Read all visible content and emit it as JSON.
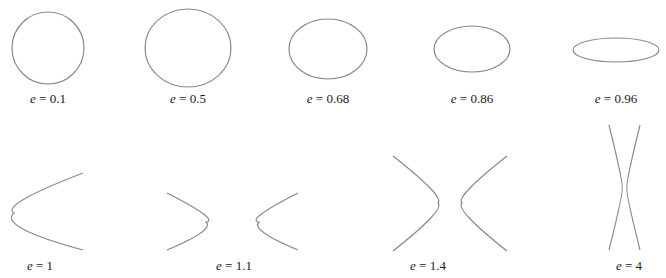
{
  "figure": {
    "stroke_color": "#8a8a8a",
    "text_color": "#222222",
    "variable": "e",
    "equals": " = ",
    "panels": [
      {
        "id": "e-0-1",
        "type": "ellipse",
        "e": "0.1",
        "label_x": 48,
        "label_y": 91
      },
      {
        "id": "e-0-5",
        "type": "ellipse",
        "e": "0.5",
        "label_x": 188,
        "label_y": 91
      },
      {
        "id": "e-0-68",
        "type": "ellipse",
        "e": "0.68",
        "label_x": 328,
        "label_y": 91
      },
      {
        "id": "e-0-86",
        "type": "ellipse",
        "e": "0.86",
        "label_x": 472,
        "label_y": 91
      },
      {
        "id": "e-0-96",
        "type": "ellipse",
        "e": "0.96",
        "label_x": 616,
        "label_y": 91
      },
      {
        "id": "e-1",
        "type": "parabola",
        "e": "1",
        "label_x": 40,
        "label_y": 258
      },
      {
        "id": "e-1-1",
        "type": "hyperbola",
        "e": "1.1",
        "label_x": 234,
        "label_y": 258
      },
      {
        "id": "e-1-4",
        "type": "hyperbola",
        "e": "1.4",
        "label_x": 428,
        "label_y": 258
      },
      {
        "id": "e-4",
        "type": "hyperbola",
        "e": "4",
        "label_x": 629,
        "label_y": 258
      }
    ]
  }
}
